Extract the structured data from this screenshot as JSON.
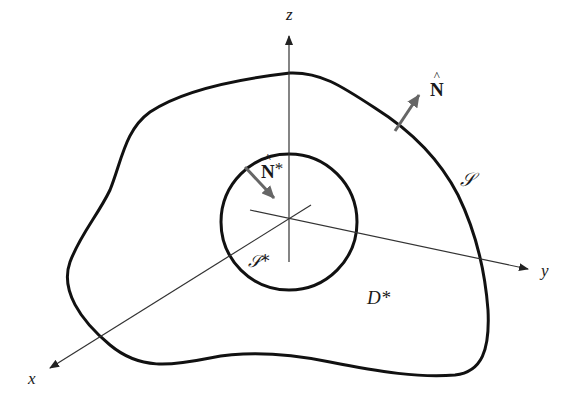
{
  "figure": {
    "axes": {
      "x_label": "x",
      "y_label": "y",
      "z_label": "z"
    },
    "outer_surface": {
      "label": "𝒮",
      "normal_label": "N",
      "normal_decoration": "hat"
    },
    "inner_surface": {
      "label": "𝒮*",
      "normal_label": "N",
      "normal_superscript": "*",
      "normal_decoration": "hat"
    },
    "region": {
      "label": "D*"
    },
    "colors": {
      "curve": "#111111",
      "axis": "#333333",
      "normal_arrow": "#666666",
      "background": "#ffffff"
    }
  }
}
